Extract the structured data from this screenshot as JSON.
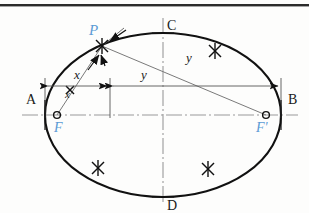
{
  "figure": {
    "type": "geometric-construction-drawing",
    "colors": {
      "outline": "#111111",
      "label_black": "#1a1a1a",
      "label_blue": "#5b9bd5",
      "axis_line": "#888888",
      "construction_line": "#777777",
      "background": "#fdfdfc",
      "top_rule": "#2b2b2b"
    },
    "labels": {
      "vertex_left": "A",
      "vertex_right": "B",
      "covertex_top": "C",
      "covertex_bottom": "D",
      "focus_left": "F",
      "focus_right": "F'",
      "point_on_curve": "P",
      "distance_short": "x",
      "distance_long": "y",
      "distance_short_lower": "x",
      "distance_long_upper": "y"
    },
    "geometry": {
      "center_x": 163,
      "center_y": 115,
      "semi_major": 118,
      "semi_minor": 82,
      "focus_left_x": 57,
      "focus_right_x": 266,
      "focus_y": 115,
      "point_P_x": 102,
      "point_P_y": 46,
      "vertex_A_x": 45,
      "vertex_B_x": 281,
      "covertex_C_y": 33,
      "covertex_D_y": 197,
      "dimension_line_y": 86,
      "dimension_split_x": 110
    },
    "construction_marks": {
      "count": 5,
      "description": "X-shaped arc intersection ticks on the ellipse curve",
      "positions": [
        {
          "x": 102,
          "y": 46
        },
        {
          "x": 215,
          "y": 51
        },
        {
          "x": 98,
          "y": 168
        },
        {
          "x": 208,
          "y": 169
        }
      ]
    },
    "notes": {
      "top_rule": "horizontal dark page rule across the top edge",
      "axes": "chain-dotted horizontal major axis and vertical minor axis",
      "string_lines": "thin construction lines from F to P and from P to F'"
    }
  }
}
